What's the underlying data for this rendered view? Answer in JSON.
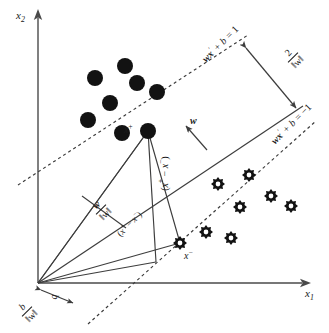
{
  "figure": {
    "width": 329,
    "height": 333,
    "background": "#ffffff",
    "ink_color": "#1a1a1a"
  },
  "axes": {
    "x_label": "x",
    "x_label_sub": "1",
    "y_label": "x",
    "y_label_sub": "2",
    "origin": {
      "x": 38,
      "y": 283
    }
  },
  "labels": {
    "margin_upper": {
      "lhs": "wx",
      "sup": "′",
      "mid": " + b = ",
      "rhs": "1"
    },
    "margin_lower": {
      "lhs": "wx",
      "sup": "′",
      "mid": " + b = ",
      "rhs": "−1"
    },
    "margin_width": {
      "numerator": "2",
      "denominator": "‖w‖"
    },
    "normal_vector": "w",
    "unit_normal": {
      "numerator": "w",
      "denominator": "‖w‖"
    },
    "bias_term": {
      "numerator": "b",
      "denominator": "‖w‖"
    },
    "support_vector_positive": {
      "base": "x",
      "sup": "+"
    },
    "support_vector_negative": {
      "base": "x",
      "sup": "−"
    },
    "difference_vector": {
      "open": "(",
      "a": "x",
      "a_sup": "+",
      "minus": " − ",
      "b": "x",
      "b_sup": "−",
      "close": ")"
    }
  },
  "chart_data": {
    "type": "scatter",
    "xlabel": "x1",
    "ylabel": "x2",
    "grid": false,
    "legend": "none",
    "xlim": [
      0,
      329
    ],
    "ylim": [
      0,
      333
    ],
    "note": "Coordinates are in image pixel space; y increases downward.",
    "series": [
      {
        "name": "positive class",
        "marker": "filled-circle",
        "color": "#121212",
        "radius": 8,
        "points": [
          {
            "x": 95,
            "y": 78
          },
          {
            "x": 125,
            "y": 66
          },
          {
            "x": 137,
            "y": 83
          },
          {
            "x": 157,
            "y": 92
          },
          {
            "x": 110,
            "y": 103
          },
          {
            "x": 88,
            "y": 120
          },
          {
            "x": 122,
            "y": 133
          }
        ]
      },
      {
        "name": "positive support vector",
        "marker": "filled-circle",
        "color": "#121212",
        "radius": 8,
        "points": [
          {
            "x": 148,
            "y": 131
          }
        ]
      },
      {
        "name": "negative class",
        "marker": "gear",
        "color": "#121212",
        "radius": 7,
        "points": [
          {
            "x": 218,
            "y": 184
          },
          {
            "x": 249,
            "y": 175
          },
          {
            "x": 271,
            "y": 196
          },
          {
            "x": 240,
            "y": 207
          },
          {
            "x": 291,
            "y": 206
          },
          {
            "x": 206,
            "y": 232
          },
          {
            "x": 231,
            "y": 238
          }
        ]
      },
      {
        "name": "negative support vector",
        "marker": "gear",
        "color": "#121212",
        "radius": 7,
        "points": [
          {
            "x": 180,
            "y": 243
          }
        ]
      }
    ],
    "lines": [
      {
        "name": "margin boundary +1",
        "style": "dashed",
        "from": {
          "x": 22,
          "y": 182
        },
        "to": {
          "x": 244,
          "y": 38
        }
      },
      {
        "name": "decision boundary",
        "style": "solid",
        "from": {
          "x": 38,
          "y": 283
        },
        "to": {
          "x": 300,
          "y": 108
        }
      },
      {
        "name": "margin boundary -1",
        "style": "dashed",
        "from": {
          "x": 92,
          "y": 320
        },
        "to": {
          "x": 312,
          "y": 124
        }
      },
      {
        "name": "margin width arrow",
        "style": "double-arrow",
        "from": {
          "x": 240,
          "y": 42
        },
        "to": {
          "x": 300,
          "y": 112
        }
      },
      {
        "name": "normal vector w",
        "style": "arrow",
        "from": {
          "x": 206,
          "y": 148
        },
        "to": {
          "x": 184,
          "y": 124
        }
      },
      {
        "name": "bias arrow b",
        "style": "double-arrow",
        "from": {
          "x": 40,
          "y": 289
        },
        "to": {
          "x": 72,
          "y": 302
        }
      }
    ]
  }
}
